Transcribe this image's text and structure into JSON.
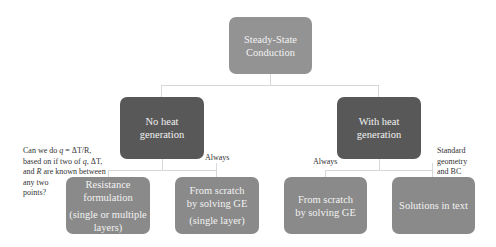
{
  "diagram": {
    "root": {
      "lines": [
        "Steady-State",
        "Conduction"
      ]
    },
    "branches": [
      {
        "id": "no-heat-generation",
        "lines": [
          "No heat",
          "generation"
        ],
        "children": [
          {
            "id": "resistance-formulation",
            "edge_label": "Can we do q = ΔT/R, based on if two of q, ΔT, and R are known between any two points?",
            "lines": [
              "Resistance",
              "formulation"
            ],
            "sub_lines": [
              "(single or multiple",
              "layers)"
            ]
          },
          {
            "id": "from-scratch-single-layer",
            "edge_label": "Always",
            "lines": [
              "From scratch",
              "by solving GE"
            ],
            "sub_lines": [
              "(single layer)"
            ]
          }
        ]
      },
      {
        "id": "with-heat-generation",
        "lines": [
          "With heat",
          "generation"
        ],
        "children": [
          {
            "id": "from-scratch",
            "edge_label": "Always",
            "lines": [
              "From scratch",
              "by solving GE"
            ]
          },
          {
            "id": "solutions-in-text",
            "edge_label": "Standard geometry and BC",
            "lines": [
              "Solutions in text"
            ]
          }
        ]
      }
    ],
    "edge_label_parts": {
      "resistance": {
        "l1a": "Can we do ",
        "q1": "q",
        "eq": " = ΔT/R,",
        "l2a": "based on if two of ",
        "q2": "q",
        "l2b": ", ΔT,",
        "l3a": "and ",
        "R": "R",
        "l3b": " are known between",
        "l4": "any two",
        "l5": "points?"
      },
      "standard": [
        "Standard",
        "geometry",
        "and BC"
      ]
    },
    "colors": {
      "root_box": "#939393",
      "level1_box": "#585858",
      "leaf_box": "#8a8a8a",
      "connector": "#d8d8d8",
      "box_text": "#f2f2f2",
      "label_text": "#333333"
    }
  }
}
